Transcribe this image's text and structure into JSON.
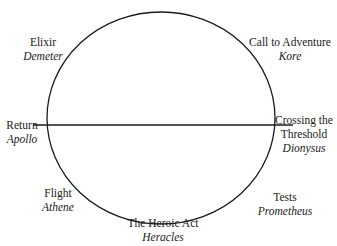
{
  "diagram": {
    "title": "",
    "shape": {
      "type": "ellipse",
      "cx": 161,
      "cy": 118,
      "rx": 114,
      "ry": 106,
      "stroke": "#1a1a1a"
    },
    "axis_line": {
      "x1": 33,
      "y1": 125,
      "x2": 293,
      "y2": 125,
      "stroke": "#1a1a1a"
    },
    "nodes": [
      {
        "id": "elixir",
        "stage": "Elixir",
        "deity": "Demeter",
        "position": "upper-left"
      },
      {
        "id": "call-to-adventure",
        "stage": "Call to Adventure",
        "deity": "Kore",
        "position": "upper-right"
      },
      {
        "id": "return",
        "stage": "Return",
        "deity": "Apollo",
        "position": "left"
      },
      {
        "id": "crossing-threshold",
        "stage_line1": "Crossing the",
        "stage_line2": "Threshold",
        "deity": "Dionysus",
        "position": "right"
      },
      {
        "id": "flight",
        "stage": "Flight",
        "deity": "Athene",
        "position": "lower-left"
      },
      {
        "id": "heroic-act",
        "stage": "The Heroic Act",
        "deity": "Heracles",
        "position": "bottom"
      },
      {
        "id": "tests",
        "stage": "Tests",
        "deity": "Prometheus",
        "position": "lower-right"
      }
    ]
  }
}
